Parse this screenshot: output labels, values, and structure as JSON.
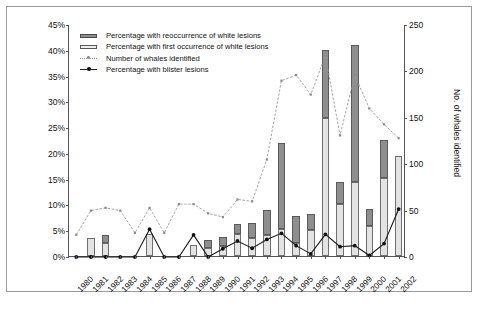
{
  "chart_data": {
    "type": "bar",
    "title": "",
    "xlabel": "",
    "ylabel": "Percentage of identified whales with lesions",
    "ylabel_right": "No. of whales identified",
    "ylim": [
      0,
      45
    ],
    "ylim_right": [
      0,
      250
    ],
    "grid": false,
    "legend_position": "top-left",
    "categories": [
      "1980",
      "1981",
      "1982",
      "1983",
      "1984",
      "1985",
      "1986",
      "1987",
      "1988",
      "1989",
      "1990",
      "1991",
      "1992",
      "1993",
      "1994",
      "1995",
      "1996",
      "1997",
      "1998",
      "1999",
      "2000",
      "2001",
      "2002"
    ],
    "yticks": [
      "0%",
      "5%",
      "10%",
      "15%",
      "20%",
      "25%",
      "30%",
      "35%",
      "40%",
      "45%"
    ],
    "yticks_right": [
      "0",
      "50",
      "100",
      "150",
      "200",
      "250"
    ],
    "series": [
      {
        "name": "Percentage with first occurrence of white lesions",
        "type": "bar",
        "stack": "white-lesions",
        "axis": "left",
        "color": "#e3e3e3",
        "values": [
          0,
          3.4,
          2.6,
          0,
          0,
          4.3,
          0,
          0,
          2.1,
          1.5,
          2.0,
          4.2,
          3.4,
          4.0,
          5.3,
          2.6,
          5.0,
          26.8,
          10.0,
          14.4,
          5.8,
          15.1,
          19.4
        ]
      },
      {
        "name": "Percentage with reoccurrence of white lesions",
        "type": "bar",
        "stack": "white-lesions",
        "axis": "left",
        "color": "#8e8e8e",
        "values": [
          0,
          0,
          1.4,
          0,
          0,
          0,
          0,
          0,
          0,
          1.7,
          1.7,
          2.1,
          3.0,
          5.0,
          16.6,
          5.1,
          3.2,
          13.2,
          4.4,
          26.6,
          3.4,
          7.5,
          0
        ]
      },
      {
        "name": "Number of whales identified",
        "type": "line",
        "axis": "right",
        "color": "#8f8f8f",
        "values": [
          24,
          50,
          53,
          50,
          26,
          53,
          26,
          57,
          57,
          47,
          43,
          62,
          60,
          105,
          190,
          196,
          175,
          217,
          131,
          196,
          160,
          143,
          128
        ]
      },
      {
        "name": "Percentage with blister lesions",
        "type": "line",
        "axis": "left",
        "color": "#111111",
        "values": [
          0,
          0,
          0,
          0,
          0,
          5.4,
          0,
          0,
          4.3,
          0,
          1.6,
          3.1,
          1.7,
          3.4,
          4.6,
          2.2,
          0.6,
          4.4,
          2.0,
          2.2,
          0.3,
          2.6,
          9.3
        ]
      }
    ]
  },
  "legend": {
    "items": [
      {
        "key": "recur-swatch",
        "label": "Percentage with reoccurrence of white lesions"
      },
      {
        "key": "first-swatch",
        "label": "Percentage with first occurrence of white lesions"
      },
      {
        "key": "whales-line",
        "label": "Number of whales identified"
      },
      {
        "key": "blister-line",
        "label": "Percentage with blister lesions"
      }
    ]
  }
}
